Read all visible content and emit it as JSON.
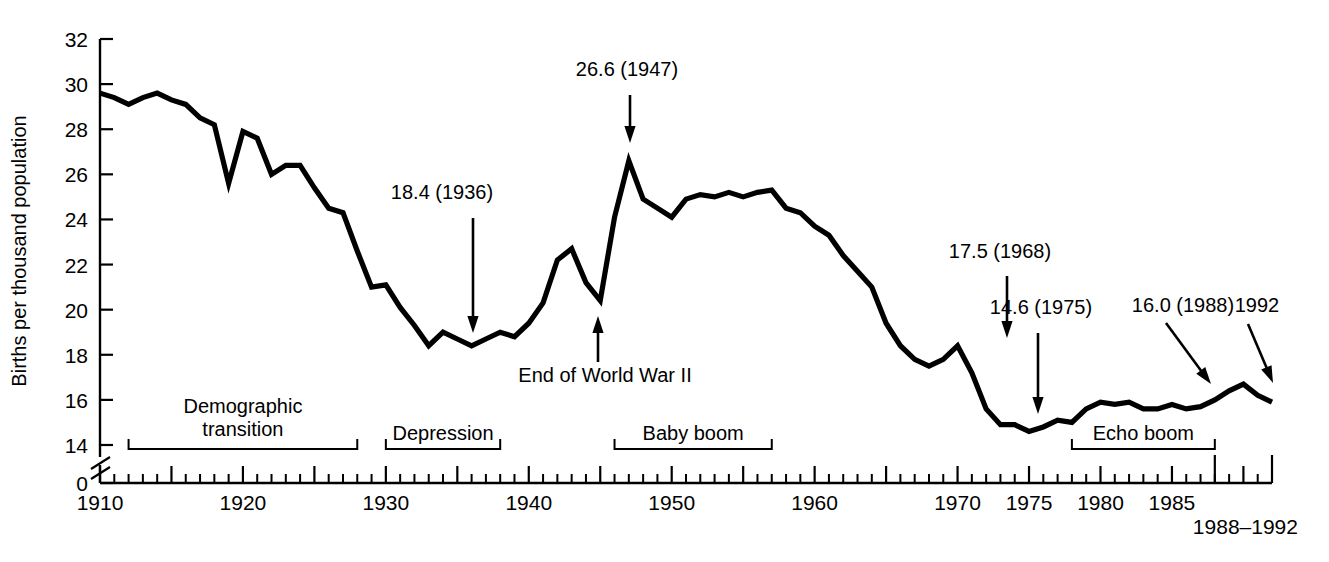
{
  "chart_data": {
    "type": "line",
    "title": "",
    "subtitle": "",
    "xlabel": "",
    "ylabel": "Births per thousand population",
    "xlim": [
      1910,
      1992
    ],
    "ylim": [
      14,
      32
    ],
    "y_axis_break": true,
    "y_axis_break_note": "axis broken between 14 and 0",
    "grid": false,
    "legend": "none",
    "y_ticks": [
      0,
      14,
      16,
      18,
      20,
      22,
      24,
      26,
      28,
      30,
      32
    ],
    "y_tick_labels": [
      "0",
      "14",
      "16",
      "18",
      "20",
      "22",
      "24",
      "26",
      "28",
      "30",
      "32"
    ],
    "x_ticks": [
      1910,
      1920,
      1930,
      1940,
      1950,
      1960,
      1970,
      1975,
      1980,
      1985
    ],
    "x_tick_labels": [
      "1910",
      "1920",
      "1930",
      "1940",
      "1950",
      "1960",
      "1970",
      "1975",
      "1980",
      "1985"
    ],
    "x_extra_label": "1988–1992",
    "x_minor_tick_interval": 1,
    "x_major_tick_interval": 5,
    "series": [
      {
        "name": "US crude birth rate",
        "x": [
          1910,
          1911,
          1912,
          1913,
          1914,
          1915,
          1916,
          1917,
          1918,
          1919,
          1920,
          1921,
          1922,
          1923,
          1924,
          1925,
          1926,
          1927,
          1928,
          1929,
          1930,
          1931,
          1932,
          1933,
          1934,
          1935,
          1936,
          1937,
          1938,
          1939,
          1940,
          1941,
          1942,
          1943,
          1944,
          1945,
          1946,
          1947,
          1948,
          1949,
          1950,
          1951,
          1952,
          1953,
          1954,
          1955,
          1956,
          1957,
          1958,
          1959,
          1960,
          1961,
          1962,
          1963,
          1964,
          1965,
          1966,
          1967,
          1968,
          1969,
          1970,
          1971,
          1972,
          1973,
          1974,
          1975,
          1976,
          1977,
          1978,
          1979,
          1980,
          1981,
          1982,
          1983,
          1984,
          1985,
          1986,
          1987,
          1988,
          1989,
          1990,
          1991,
          1992
        ],
        "values": [
          29.6,
          29.4,
          29.1,
          29.4,
          29.6,
          29.3,
          29.1,
          28.5,
          28.2,
          25.6,
          27.9,
          27.6,
          26.0,
          26.4,
          26.4,
          25.4,
          24.5,
          24.3,
          22.6,
          21.0,
          21.1,
          20.1,
          19.3,
          18.4,
          19.0,
          18.7,
          18.4,
          18.7,
          19.0,
          18.8,
          19.4,
          20.3,
          22.2,
          22.7,
          21.2,
          20.4,
          24.1,
          26.6,
          24.9,
          24.5,
          24.1,
          24.9,
          25.1,
          25.0,
          25.2,
          25.0,
          25.2,
          25.3,
          24.5,
          24.3,
          23.7,
          23.3,
          22.4,
          21.7,
          21.0,
          19.4,
          18.4,
          17.8,
          17.5,
          17.8,
          18.4,
          17.2,
          15.6,
          14.9,
          14.9,
          14.6,
          14.8,
          15.1,
          15.0,
          15.6,
          15.9,
          15.8,
          15.9,
          15.6,
          15.6,
          15.8,
          15.6,
          15.7,
          16.0,
          16.4,
          16.7,
          16.2,
          15.9
        ]
      }
    ],
    "annotations": [
      {
        "id": "anno-1936",
        "label": "18.4 (1936)",
        "value": 18.4,
        "year": 1936,
        "arrow": "down"
      },
      {
        "id": "anno-1947",
        "label": "26.6 (1947)",
        "value": 26.6,
        "year": 1947,
        "arrow": "down"
      },
      {
        "id": "anno-wwii",
        "label": "End of World War II",
        "value": 20.4,
        "year": 1945,
        "arrow": "up"
      },
      {
        "id": "anno-1968",
        "label": "17.5 (1968)",
        "value": 17.5,
        "year": 1968,
        "arrow": "down"
      },
      {
        "id": "anno-1975",
        "label": "14.6 (1975)",
        "value": 14.6,
        "year": 1975,
        "arrow": "down"
      },
      {
        "id": "anno-1988",
        "label": "16.0 (1988)",
        "value": 16.0,
        "year": 1988,
        "arrow": "down-left-diagonal"
      },
      {
        "id": "anno-1992",
        "label": "1992",
        "value": 15.9,
        "year": 1992,
        "arrow": "down"
      }
    ],
    "period_brackets": [
      {
        "id": "bracket-demographic-transition",
        "label": "Demographic transition",
        "start_year": 1912,
        "end_year": 1928
      },
      {
        "id": "bracket-depression",
        "label": "Depression",
        "start_year": 1930,
        "end_year": 1938
      },
      {
        "id": "bracket-baby-boom",
        "label": "Baby boom",
        "start_year": 1946,
        "end_year": 1957
      },
      {
        "id": "bracket-echo-boom",
        "label": "Echo boom",
        "start_year": 1978,
        "end_year": 1988
      }
    ],
    "colors": {
      "line": "#000000",
      "axis": "#000000",
      "background": "#ffffff"
    }
  }
}
